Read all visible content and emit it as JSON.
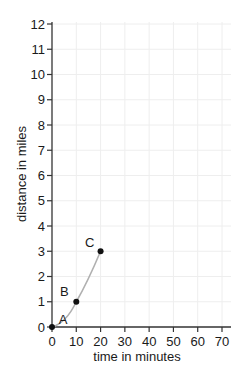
{
  "chart_data": {
    "type": "line",
    "title": "",
    "xlabel": "time in minutes",
    "ylabel": "distance in miles",
    "xlim": [
      0,
      70
    ],
    "ylim": [
      0,
      12
    ],
    "x_ticks": [
      0,
      10,
      20,
      30,
      40,
      50,
      60,
      70
    ],
    "y_ticks": [
      0,
      1,
      2,
      3,
      4,
      5,
      6,
      7,
      8,
      9,
      10,
      11,
      12
    ],
    "grid": true,
    "legend": null,
    "series": [
      {
        "name": "journey",
        "color": "#b0b0b0",
        "x": [
          0,
          10,
          20
        ],
        "y": [
          0,
          1,
          3
        ],
        "curve": "smooth",
        "points": [
          {
            "label": "A",
            "x": 0,
            "y": 0
          },
          {
            "label": "B",
            "x": 10,
            "y": 1
          },
          {
            "label": "C",
            "x": 20,
            "y": 3
          }
        ]
      }
    ],
    "colors": {
      "axis": "#333333",
      "grid": "#eeeeee",
      "curve": "#b0b0b0",
      "points": "#111111"
    }
  }
}
